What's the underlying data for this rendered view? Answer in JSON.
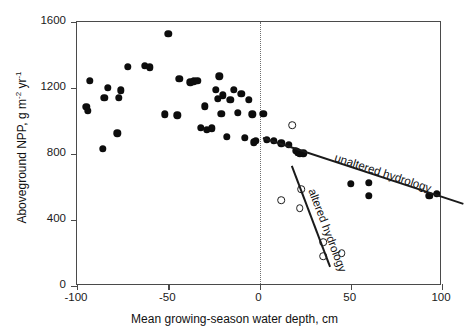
{
  "figure": {
    "x_axis_title": "Mean growing-season water depth, cm",
    "y_axis_title_main": "Aboveground NPP, g m",
    "y_axis_title_sup1": "-2",
    "y_axis_title_mid": " yr",
    "y_axis_title_sup2": "-1"
  },
  "annotations": {
    "unaltered": "unaltered hydrology",
    "altered": "altered hydrology"
  },
  "chart_data": {
    "type": "scatter",
    "title": "",
    "xlabel": "Mean growing-season water depth, cm",
    "ylabel": "Aboveground NPP, g m-2 yr-1",
    "xlim": [
      -100,
      100
    ],
    "ylim": [
      0,
      1600
    ],
    "xticks": [
      -100,
      -50,
      0,
      50,
      100
    ],
    "yticks": [
      0,
      400,
      800,
      1200,
      1600
    ],
    "xtick_labels": [
      "-100",
      "-50",
      "0",
      "50",
      "100"
    ],
    "ytick_labels": [
      "0",
      "400",
      "800",
      "1200",
      "1600"
    ],
    "grid": false,
    "legend": "inline-annotations",
    "reference_lines": [
      {
        "name": "zero-water-depth",
        "orientation": "vertical",
        "x": 0,
        "style": "dotted"
      }
    ],
    "series": [
      {
        "name": "unaltered hydrology",
        "marker": "filled-circle",
        "color": "#0d0d0d",
        "points": [
          [
            -93,
            1245
          ],
          [
            -95,
            1085
          ],
          [
            -94,
            1060
          ],
          [
            -83,
            1200
          ],
          [
            -85,
            1140
          ],
          [
            -86,
            830
          ],
          [
            -77,
            1140
          ],
          [
            -76,
            1185
          ],
          [
            -78,
            925
          ],
          [
            -72,
            1330
          ],
          [
            -63,
            1335
          ],
          [
            -60,
            1325
          ],
          [
            -50,
            1530
          ],
          [
            -52,
            1040
          ],
          [
            -45,
            1035
          ],
          [
            -44,
            1255
          ],
          [
            -38,
            1235
          ],
          [
            -36,
            1240
          ],
          [
            -34,
            1245
          ],
          [
            -30,
            1090
          ],
          [
            -32,
            960
          ],
          [
            -29,
            945
          ],
          [
            -26,
            955
          ],
          [
            -22,
            1270
          ],
          [
            -24,
            1190
          ],
          [
            -23,
            1135
          ],
          [
            -20,
            1155
          ],
          [
            -21,
            1045
          ],
          [
            -18,
            905
          ],
          [
            -16,
            1130
          ],
          [
            -14,
            1190
          ],
          [
            -12,
            1050
          ],
          [
            -10,
            1165
          ],
          [
            -8,
            900
          ],
          [
            -6,
            1130
          ],
          [
            -4,
            1040
          ],
          [
            -2,
            880
          ],
          [
            -3,
            870
          ],
          [
            2,
            1045
          ],
          [
            4,
            885
          ],
          [
            8,
            880
          ],
          [
            12,
            865
          ],
          [
            16,
            855
          ],
          [
            20,
            820
          ],
          [
            21,
            810
          ],
          [
            22,
            800
          ],
          [
            24,
            805
          ],
          [
            50,
            620
          ],
          [
            60,
            625
          ],
          [
            60,
            545
          ],
          [
            93,
            545
          ],
          [
            97,
            560
          ]
        ]
      },
      {
        "name": "altered hydrology",
        "marker": "open-circle",
        "color": "#ffffff",
        "points": [
          [
            18,
            975
          ],
          [
            12,
            520
          ],
          [
            23,
            585
          ],
          [
            22,
            470
          ],
          [
            35,
            265
          ],
          [
            35,
            180
          ],
          [
            45,
            200
          ]
        ]
      }
    ],
    "trend_lines": [
      {
        "name": "unaltered hydrology",
        "x_start": 2,
        "y_start": 903,
        "x_end": 112,
        "y_end": 503,
        "label": "unaltered hydrology"
      },
      {
        "name": "altered hydrology",
        "x_start": 18,
        "y_start": 733,
        "x_end": 39,
        "y_end": 120,
        "label": "altered hydrology"
      }
    ]
  }
}
